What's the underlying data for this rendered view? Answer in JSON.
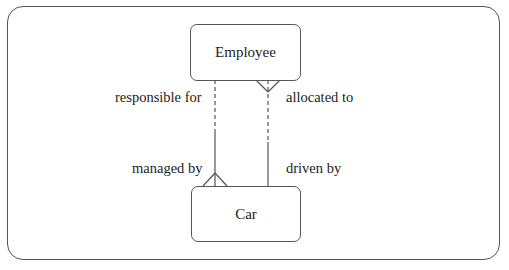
{
  "diagram": {
    "type": "entity-relationship",
    "entities": [
      {
        "id": "employee",
        "label": "Employee"
      },
      {
        "id": "car",
        "label": "Car"
      }
    ],
    "relationships": [
      {
        "from": "employee",
        "to": "car",
        "label_near_employee": "responsible for",
        "label_near_car": "managed by",
        "employee_end": {
          "style": "dashed",
          "cardinality": "one"
        },
        "car_end": {
          "style": "solid",
          "cardinality": "many"
        }
      },
      {
        "from": "employee",
        "to": "car",
        "label_near_employee": "allocated to",
        "label_near_car": "driven by",
        "employee_end": {
          "style": "dashed",
          "cardinality": "many"
        },
        "car_end": {
          "style": "solid",
          "cardinality": "one"
        }
      }
    ],
    "colors": {
      "line": "#555555",
      "text": "#222222",
      "background": "#ffffff"
    }
  },
  "labels": {
    "employee": "Employee",
    "car": "Car",
    "responsible_for": "responsible for",
    "managed_by": "managed by",
    "allocated_to": "allocated to",
    "driven_by": "driven by"
  }
}
